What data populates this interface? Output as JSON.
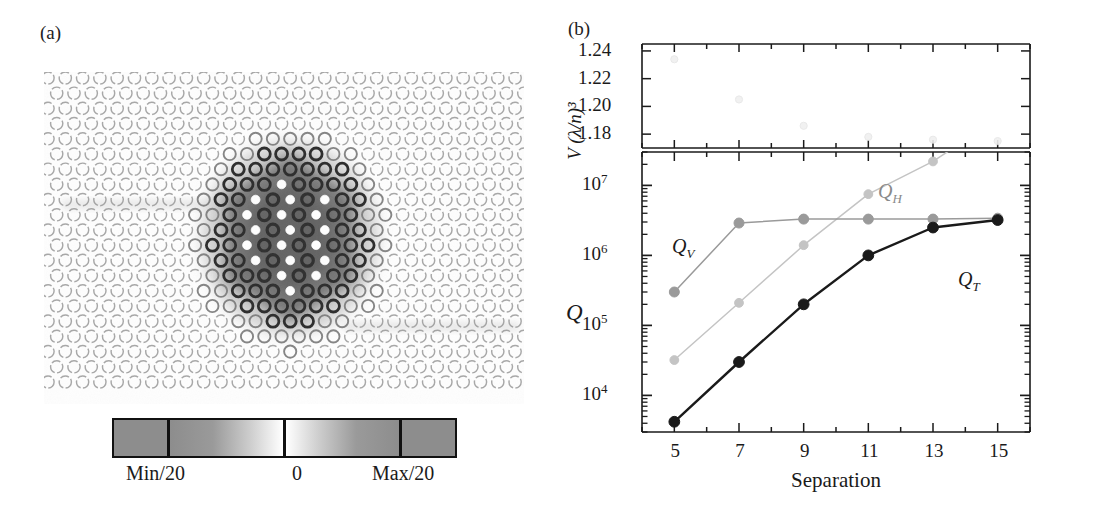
{
  "figure": {
    "panel_a_label": "(a)",
    "panel_b_label": "(b)"
  },
  "panel_a": {
    "description": "photonic-crystal-mode-profile",
    "lattice": {
      "type": "triangular-air-hole-array",
      "rows": 21,
      "cols": 28,
      "hole_radius_px": 6.1,
      "pitch_x_px": 17.3,
      "pitch_y_px": 15.2
    },
    "mode": {
      "center_x_px": 246,
      "center_y_px": 166,
      "shape": "hexagonal-localized-mode",
      "dark_fill": "#6f6f6f"
    },
    "colorbar": {
      "name": "field-amplitude-colorbar",
      "segments": [
        {
          "name": "saturated-min",
          "fill": "#8d8d8d"
        },
        {
          "name": "min-to-zero-gradient",
          "from": "#8d8d8d",
          "to": "#ffffff"
        },
        {
          "name": "zero-to-max-gradient",
          "from": "#ffffff",
          "to": "#8d8d8d"
        },
        {
          "name": "saturated-max",
          "fill": "#8d8d8d"
        }
      ],
      "tick_labels": [
        "Min/20",
        "0",
        "Max/20"
      ]
    }
  },
  "chart_data": [
    {
      "type": "scatter",
      "name": "mode-volume-panel",
      "title": "",
      "xlabel": "",
      "ylabel": "V (λ/n)³",
      "x": [
        5,
        7,
        9,
        11,
        13,
        15
      ],
      "values": [
        1.234,
        1.205,
        1.186,
        1.178,
        1.176,
        1.175
      ],
      "xlim": [
        4,
        16
      ],
      "ylim": [
        1.17,
        1.245
      ],
      "ytick_labels": [
        "1.24",
        "1.22",
        "1.20",
        "1.18"
      ],
      "yticks": [
        1.24,
        1.22,
        1.2,
        1.18
      ],
      "grid": false,
      "legend": "none",
      "note": "data points are extremely faint in the source scan"
    },
    {
      "type": "line",
      "name": "quality-factor-panel",
      "title": "",
      "xlabel": "Separation",
      "ylabel": "Q",
      "yscale": "log",
      "categories": [
        5,
        7,
        9,
        11,
        13,
        15
      ],
      "xtick_labels": [
        "5",
        "7",
        "9",
        "11",
        "13",
        "15"
      ],
      "ytick_labels": [
        "10⁴",
        "10⁵",
        "10⁶",
        "10⁷"
      ],
      "yticks": [
        10000,
        100000,
        1000000,
        10000000
      ],
      "xlim": [
        4,
        16
      ],
      "ylim": [
        3000,
        30000000
      ],
      "grid": false,
      "legend": "inline-annotations",
      "series": [
        {
          "name": "Q_V",
          "label": "Q",
          "sub": "V",
          "color": "#9a9a9a",
          "values": [
            300000,
            2900000,
            3300000,
            3300000,
            3300000,
            3400000
          ]
        },
        {
          "name": "Q_H",
          "label": "Q",
          "sub": "H",
          "color": "#c4c4c4",
          "values": [
            32000,
            210000,
            1400000,
            7500000,
            22000000,
            90000000
          ]
        },
        {
          "name": "Q_T",
          "label": "Q",
          "sub": "T",
          "color": "#1a1a1a",
          "values": [
            4200,
            30000,
            200000,
            1000000,
            2500000,
            3200000
          ]
        }
      ]
    }
  ]
}
